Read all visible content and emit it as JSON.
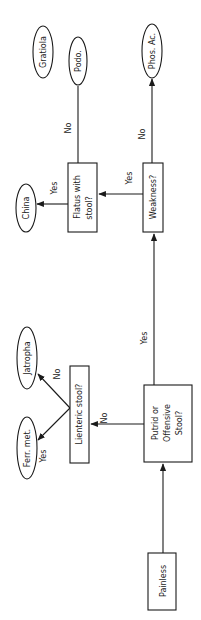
{
  "diagram": {
    "type": "flowchart",
    "orientation": "rotated-90-ccw",
    "colors": {
      "stroke": "#1a1a1a",
      "background": "#ffffff",
      "text": "#1a1a1a"
    },
    "nodes": {
      "painless": {
        "label": "Painless",
        "shape": "rectangle"
      },
      "putrid": {
        "line1": "Putrid or",
        "line2": "Offensive",
        "line3": "Stool?",
        "shape": "rectangle"
      },
      "lienteric": {
        "label": "Lienteric stool?",
        "shape": "rectangle"
      },
      "weakness": {
        "label": "Weakness?",
        "shape": "rectangle"
      },
      "flatus": {
        "line1": "Flatus with",
        "line2": "stool?",
        "shape": "rectangle"
      },
      "ferr_met": {
        "label": "Ferr. met.",
        "shape": "ellipse"
      },
      "jatropha": {
        "label": "Jatropha",
        "shape": "ellipse"
      },
      "china": {
        "label": "China",
        "shape": "ellipse"
      },
      "podo": {
        "label": "Podo.",
        "shape": "ellipse"
      },
      "gratiola": {
        "label": "Gratiola",
        "shape": "ellipse"
      },
      "phos_ac": {
        "label": "Phos. Ac.",
        "shape": "ellipse"
      }
    },
    "edges": [
      {
        "from": "painless",
        "to": "putrid",
        "label": ""
      },
      {
        "from": "putrid",
        "to": "lienteric",
        "label": "No"
      },
      {
        "from": "putrid",
        "to": "weakness",
        "label": "Yes"
      },
      {
        "from": "lienteric",
        "to": "ferr_met",
        "label": "Yes"
      },
      {
        "from": "lienteric",
        "to": "jatropha",
        "label": "No"
      },
      {
        "from": "weakness",
        "to": "flatus",
        "label": "Yes"
      },
      {
        "from": "weakness",
        "to": "phos_ac",
        "label": "No"
      },
      {
        "from": "flatus",
        "to": "china",
        "label": "Yes"
      },
      {
        "from": "flatus",
        "to": "podo",
        "label": "No"
      }
    ]
  }
}
